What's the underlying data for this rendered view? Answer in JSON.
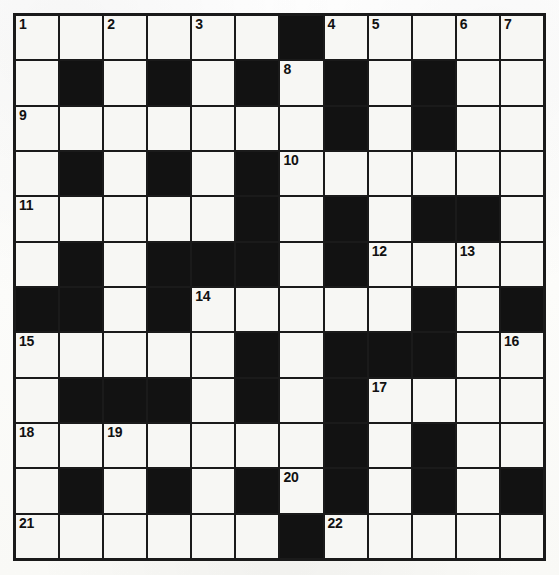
{
  "puzzle": {
    "kind": "crossword-grid",
    "rows": 12,
    "columns": 12,
    "colors": {
      "block": "#121212",
      "open": "#f7f7f4",
      "border": "#1a1a1a",
      "number_text": "#111111",
      "page_background": "#fdfdfb"
    },
    "numbered_clues": [
      1,
      2,
      3,
      4,
      5,
      6,
      7,
      8,
      9,
      10,
      11,
      12,
      13,
      14,
      15,
      16,
      17,
      18,
      19,
      20,
      21,
      22
    ],
    "grid": [
      [
        "open",
        "open",
        "open",
        "open",
        "open",
        "open",
        "block",
        "open",
        "open",
        "open",
        "open",
        "open"
      ],
      [
        "open",
        "block",
        "open",
        "block",
        "open",
        "block",
        "open",
        "block",
        "open",
        "block",
        "open",
        "open"
      ],
      [
        "open",
        "open",
        "open",
        "open",
        "open",
        "open",
        "open",
        "block",
        "open",
        "block",
        "open",
        "open"
      ],
      [
        "open",
        "block",
        "open",
        "block",
        "open",
        "block",
        "open",
        "open",
        "open",
        "open",
        "open",
        "open"
      ],
      [
        "open",
        "open",
        "open",
        "open",
        "open",
        "block",
        "open",
        "block",
        "open",
        "block",
        "block",
        "open"
      ],
      [
        "open",
        "block",
        "open",
        "block",
        "block",
        "block",
        "open",
        "block",
        "open",
        "open",
        "open",
        "open"
      ],
      [
        "block",
        "block",
        "open",
        "block",
        "open",
        "open",
        "open",
        "open",
        "open",
        "block",
        "open",
        "block"
      ],
      [
        "open",
        "open",
        "open",
        "open",
        "open",
        "block",
        "open",
        "block",
        "block",
        "block",
        "open",
        "open"
      ],
      [
        "open",
        "block",
        "block",
        "block",
        "open",
        "block",
        "open",
        "block",
        "open",
        "open",
        "open",
        "open"
      ],
      [
        "open",
        "open",
        "open",
        "open",
        "open",
        "open",
        "open",
        "block",
        "open",
        "block",
        "open",
        "open"
      ],
      [
        "open",
        "block",
        "open",
        "block",
        "open",
        "block",
        "open",
        "block",
        "open",
        "block",
        "open",
        "block"
      ],
      [
        "open",
        "open",
        "open",
        "open",
        "open",
        "open",
        "block",
        "open",
        "open",
        "open",
        "open",
        "open"
      ]
    ],
    "numbers": [
      [
        "1",
        "",
        "2",
        "",
        "3",
        "",
        "",
        "4",
        "5",
        "",
        "6",
        ""
      ],
      [
        "",
        "",
        "",
        "",
        "",
        "",
        "8",
        "",
        "",
        "",
        "",
        ""
      ],
      [
        "9",
        "",
        "",
        "",
        "",
        "",
        "",
        "",
        "",
        "",
        "",
        ""
      ],
      [
        "",
        "",
        "",
        "",
        "",
        "",
        "10",
        "",
        "",
        "",
        "",
        ""
      ],
      [
        "11",
        "",
        "",
        "",
        "",
        "",
        "",
        "",
        "",
        "",
        "",
        ""
      ],
      [
        "",
        "",
        "",
        "",
        "",
        "",
        "",
        "",
        "12",
        "",
        "13",
        ""
      ],
      [
        "",
        "",
        "",
        "",
        "14",
        "",
        "",
        "",
        "",
        "",
        "",
        ""
      ],
      [
        "15",
        "",
        "",
        "",
        "",
        "",
        "",
        "",
        "",
        "",
        "",
        "16"
      ],
      [
        "",
        "",
        "",
        "",
        "",
        "",
        "",
        "",
        "17",
        "",
        "",
        ""
      ],
      [
        "18",
        "",
        "19",
        "",
        "",
        "",
        "",
        "",
        "",
        "",
        "",
        ""
      ],
      [
        "",
        "",
        "",
        "",
        "",
        "",
        "20",
        "",
        "",
        "",
        "",
        ""
      ],
      [
        "21",
        "",
        "",
        "",
        "",
        "",
        "",
        "22",
        "",
        "",
        "",
        ""
      ]
    ],
    "row_7_number_7": "7"
  }
}
